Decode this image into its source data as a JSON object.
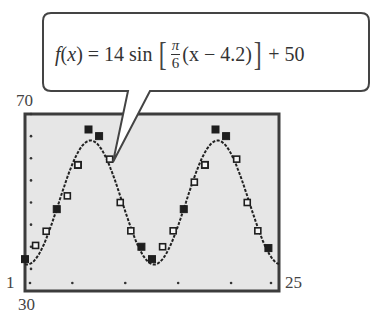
{
  "callout": {
    "f": "f",
    "x_open": "(",
    "x": "x",
    "x_close": ")",
    "eq": " = 14 sin ",
    "lbracket": "[",
    "frac_num": "π",
    "frac_den": "6",
    "inner": "(x − 4.2)",
    "rbracket": "]",
    "tail": " + 50"
  },
  "axes": {
    "ymax_label": "70",
    "ymin_label": "30",
    "xmin_label": "1",
    "xmax_label": "25"
  },
  "colors": {
    "plot_bg": "#e6e6e6",
    "frame": "#3c3c3c",
    "curve": "#222222",
    "marker": "#1e1e1e"
  },
  "chart_data": {
    "type": "scatter",
    "xlabel": "",
    "ylabel": "",
    "xlim": [
      1,
      25
    ],
    "ylim": [
      30,
      70
    ],
    "grid": false,
    "curve": {
      "name": "f(x) = 14 sin[(π/6)(x − 4.2)] + 50",
      "amplitude": 14,
      "period": 12,
      "phase_shift": 4.2,
      "vertical_shift": 50
    },
    "series": [
      {
        "name": "data (filled markers)",
        "marker": "filled-square",
        "x": [
          1,
          4,
          6,
          7,
          8,
          12,
          13,
          16,
          18,
          19,
          20,
          24
        ],
        "y": [
          37.2,
          48.5,
          58.5,
          66.5,
          65.0,
          40.0,
          37.2,
          48.5,
          58.5,
          66.5,
          65.0,
          39.7
        ]
      },
      {
        "name": "model values (open markers)",
        "marker": "open-square",
        "x": [
          2,
          3,
          5,
          6,
          9,
          10,
          11,
          14,
          15,
          17,
          18,
          21,
          22,
          23
        ],
        "y": [
          40.3,
          43.5,
          51.5,
          58.5,
          59.8,
          50.0,
          43.6,
          40.0,
          43.6,
          54.6,
          58.5,
          59.8,
          50.0,
          43.6
        ]
      }
    ],
    "x_ticks": [
      1,
      5,
      10,
      15,
      20,
      25
    ],
    "y_ticks": [
      30,
      35,
      40,
      45,
      50,
      55,
      60,
      65,
      70
    ]
  }
}
